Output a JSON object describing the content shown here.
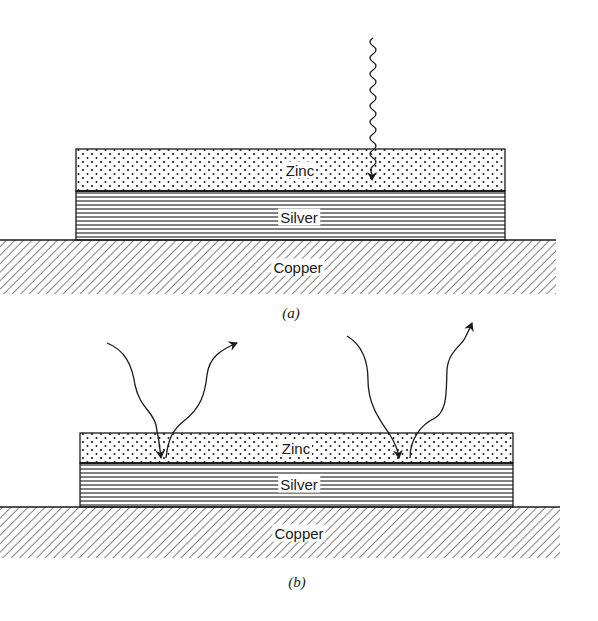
{
  "figure": {
    "panels": [
      {
        "id": "a",
        "caption": "(a)",
        "layers": {
          "zinc": "Zinc",
          "silver": "Silver",
          "copper": "Copper"
        },
        "arrows": [
          "incoming-wavy-photon"
        ]
      },
      {
        "id": "b",
        "caption": "(b)",
        "layers": {
          "zinc": "Zinc",
          "silver": "Silver",
          "copper": "Copper"
        },
        "arrows": [
          "incoming-curved-left",
          "outgoing-curved-left",
          "incoming-curved-right",
          "outgoing-curved-right"
        ]
      }
    ],
    "colors": {
      "ink": "#1a1a1a",
      "background": "#ffffff"
    }
  }
}
